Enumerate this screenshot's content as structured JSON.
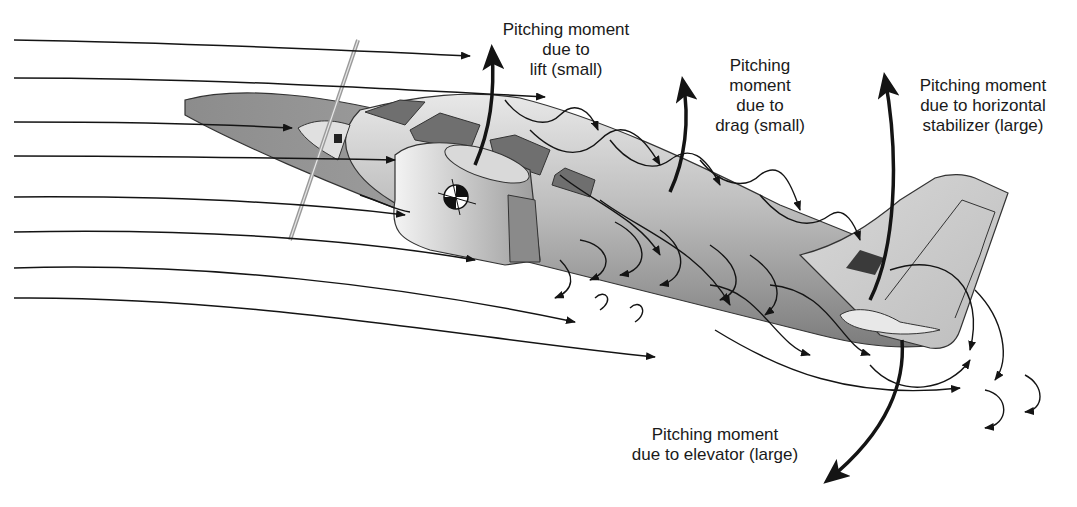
{
  "diagram": {
    "labels": {
      "lift": [
        "Pitching moment",
        "due to",
        "lift (small)"
      ],
      "drag": [
        "Pitching",
        "moment",
        "due to",
        "drag (small)"
      ],
      "stabilizer": [
        "Pitching moment",
        "due to horizontal",
        "stabilizer (large)"
      ],
      "elevator": [
        "Pitching moment",
        "due to elevator (large)"
      ]
    },
    "colors": {
      "ink": "#141414",
      "fuselage_dark": "#7a7a7a",
      "fuselage_light": "#e6e6e6",
      "window": "#6e6e6e",
      "wing_dark": "#8a8a8a",
      "background": "#ffffff"
    }
  }
}
